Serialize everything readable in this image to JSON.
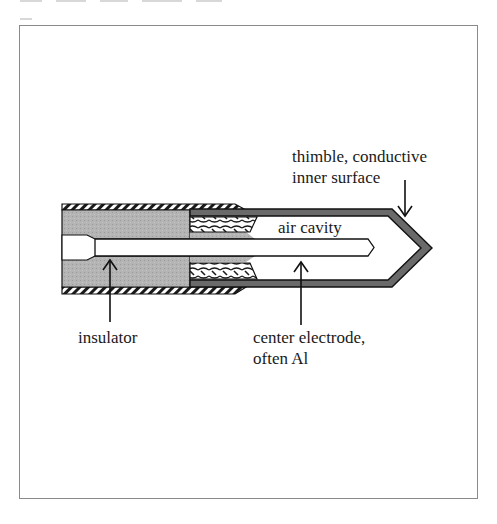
{
  "figure": {
    "labels": {
      "thimble_line1": "thimble, conductive",
      "thimble_line2": "inner surface",
      "air_cavity": "air cavity",
      "insulator": "insulator",
      "electrode_line1": "center electrode,",
      "electrode_line2": "often Al"
    },
    "colors": {
      "insulator_gray": "#b4b4b4",
      "thimble_wall": "#6a6a6a",
      "outline": "#111111",
      "frame_border": "#8a8a8a",
      "background": "#ffffff"
    },
    "components": [
      "outer hatched casing",
      "insulator",
      "braided guard ring",
      "thimble wall",
      "air cavity",
      "center electrode"
    ]
  }
}
